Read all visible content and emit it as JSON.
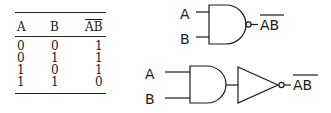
{
  "truth_table": {
    "headers": [
      "A",
      "B",
      "AB"
    ],
    "header_overline": [
      false,
      false,
      true
    ],
    "rows": [
      [
        "0",
        "0",
        "1"
      ],
      [
        "0",
        "1",
        "1"
      ],
      [
        "1",
        "0",
        "1"
      ],
      [
        "1",
        "1",
        "0"
      ]
    ]
  },
  "nand_gate": {
    "inputs": [
      "A",
      "B"
    ],
    "output": "AB",
    "output_overline": true
  },
  "and_not_circuit": {
    "inputs": [
      "A",
      "B"
    ],
    "output": "AB",
    "output_overline": true
  }
}
